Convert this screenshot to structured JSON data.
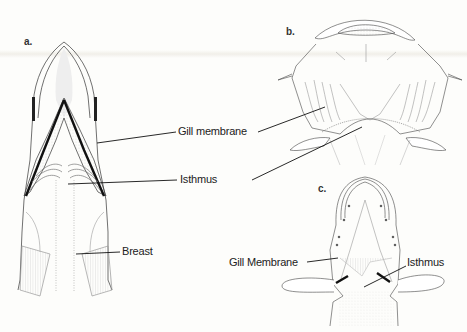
{
  "figure": {
    "panels": [
      {
        "id": "a",
        "label": "a.",
        "view": "ventral head, elongate snout"
      },
      {
        "id": "b",
        "label": "b.",
        "view": "ventral head, broad"
      },
      {
        "id": "c",
        "label": "c.",
        "view": "ventral head, small"
      }
    ],
    "labels": {
      "a_gill_membrane": "Gill membrane",
      "a_isthmus": "Isthmus",
      "a_breast": "Breast",
      "c_gill_membrane": "Gill Membrane",
      "c_isthmus": "Isthmus"
    },
    "colors": {
      "background": "#fdfdfb",
      "ink": "#222222",
      "stipple": "#9a9a9a"
    }
  }
}
